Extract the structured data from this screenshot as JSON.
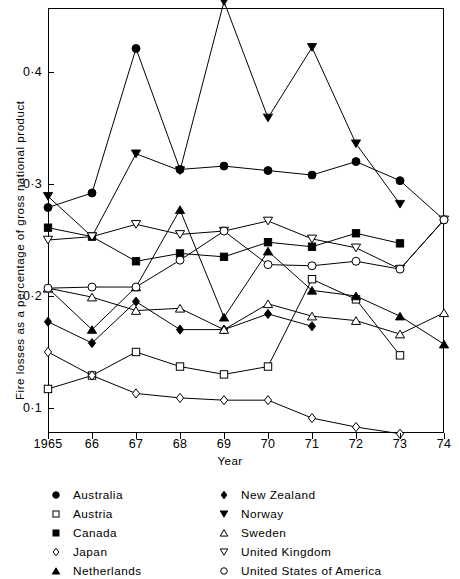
{
  "chart_data": {
    "type": "line",
    "title": "",
    "xlabel": "Year",
    "ylabel": "Fire losses as a percentage of gross national product",
    "x": [
      1965,
      1966,
      1967,
      1968,
      1969,
      1970,
      1971,
      1972,
      1973,
      1974
    ],
    "xtick_labels": [
      "1965",
      "66",
      "67",
      "68",
      "69",
      "70",
      "71",
      "72",
      "73",
      "74"
    ],
    "ytick_labels": [
      "0·4",
      "0·3",
      "0·2",
      "0·1"
    ],
    "ytick_values": [
      0.4,
      0.3,
      0.2,
      0.1
    ],
    "ylim": [
      0.077,
      0.463
    ],
    "xlim": [
      1965,
      1974
    ],
    "grid": false,
    "legend_position": "below-axes",
    "series": [
      {
        "name": "Australia",
        "marker": "filled-circle",
        "values": [
          0.279,
          0.292,
          0.421,
          0.313,
          0.316,
          0.312,
          0.308,
          0.32,
          0.303,
          0.268
        ]
      },
      {
        "name": "Austria",
        "marker": "open-square",
        "values": [
          0.117,
          0.129,
          0.15,
          0.137,
          0.13,
          0.137,
          0.215,
          0.197,
          0.147,
          null
        ]
      },
      {
        "name": "Canada",
        "marker": "filled-square",
        "values": [
          0.261,
          0.253,
          0.231,
          0.238,
          0.235,
          0.248,
          0.244,
          0.256,
          0.247,
          null
        ]
      },
      {
        "name": "Japan",
        "marker": "open-diamond",
        "values": [
          0.15,
          0.129,
          0.113,
          0.109,
          0.107,
          0.107,
          0.091,
          0.083,
          0.077,
          null
        ]
      },
      {
        "name": "Netherlands",
        "marker": "filled-triangle-up",
        "values": [
          0.207,
          0.17,
          0.208,
          0.277,
          0.181,
          0.24,
          0.205,
          0.2,
          0.182,
          0.157
        ]
      },
      {
        "name": "New Zealand",
        "marker": "filled-diamond",
        "values": [
          0.177,
          0.158,
          0.195,
          0.17,
          0.17,
          0.184,
          0.173,
          null,
          null,
          null
        ]
      },
      {
        "name": "Norway",
        "marker": "filled-triangle-down",
        "values": [
          0.289,
          0.253,
          0.327,
          0.312,
          0.463,
          0.359,
          0.422,
          0.336,
          0.282,
          null
        ]
      },
      {
        "name": "Sweden",
        "marker": "open-triangle-up",
        "values": [
          0.207,
          0.199,
          0.187,
          0.189,
          0.17,
          0.193,
          0.182,
          0.178,
          0.166,
          0.185
        ]
      },
      {
        "name": "United Kingdom",
        "marker": "open-triangle-down",
        "values": [
          0.25,
          0.253,
          0.264,
          0.255,
          0.258,
          0.267,
          0.251,
          0.243,
          0.224,
          0.268
        ]
      },
      {
        "name": "United States of America",
        "marker": "open-circle",
        "values": [
          0.207,
          0.208,
          0.208,
          0.232,
          0.258,
          0.228,
          0.227,
          0.231,
          0.224,
          0.268
        ]
      }
    ]
  },
  "axes": {
    "ylabel": "Fire losses as a percentage of gross national product",
    "xlabel": "Year"
  },
  "legend": {
    "column_left": [
      {
        "label": "Australia",
        "marker": "filled-circle"
      },
      {
        "label": "Austria",
        "marker": "open-square"
      },
      {
        "label": "Canada",
        "marker": "filled-square"
      },
      {
        "label": "Japan",
        "marker": "open-diamond"
      },
      {
        "label": "Netherlands",
        "marker": "filled-triangle-up"
      }
    ],
    "column_right": [
      {
        "label": "New Zealand",
        "marker": "filled-diamond"
      },
      {
        "label": "Norway",
        "marker": "filled-triangle-down"
      },
      {
        "label": "Sweden",
        "marker": "open-triangle-up"
      },
      {
        "label": "United Kingdom",
        "marker": "open-triangle-down"
      },
      {
        "label": "United States of America",
        "marker": "open-circle"
      }
    ]
  },
  "colors": {
    "ink": "#000000",
    "paper": "#ffffff"
  }
}
